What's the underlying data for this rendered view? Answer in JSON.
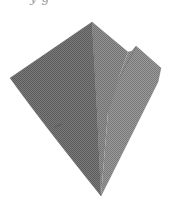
{
  "caption": {
    "text": "y     g"
  },
  "figure": {
    "colors": {
      "background": "#ffffff",
      "left_face": "#6f6f6f",
      "right_face": "#858585",
      "flap": "#8c8c8c",
      "fold_line": "#5a5a5a",
      "edge": "#4e4e4e"
    },
    "vertices": {
      "apex": [
        92,
        22
      ],
      "left_point": [
        10,
        78
      ],
      "bottom_tip": [
        101,
        196
      ],
      "right_shoulder": [
        128,
        52
      ],
      "notch": [
        132,
        51
      ],
      "flap_top": [
        136,
        46
      ],
      "flap_right": [
        161,
        68
      ],
      "right_lower": [
        158,
        82
      ]
    }
  }
}
